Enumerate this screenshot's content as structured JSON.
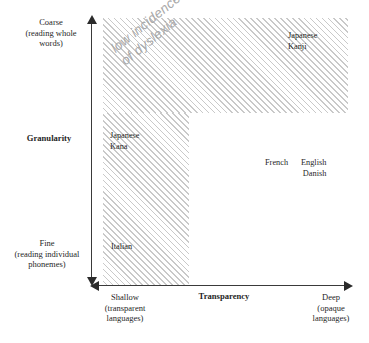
{
  "chart_data": {
    "type": "scatter",
    "title": "",
    "xlabel": "Transparency",
    "ylabel": "Granularity",
    "x_axis": {
      "label": "Transparency",
      "low_end": "Shallow\n(transparent\nlanguages)",
      "high_end": "Deep\n(opaque\nlanguages)",
      "arrows": "both"
    },
    "y_axis": {
      "label": "Granularity",
      "high_end": "Coarse\n(reading whole\nwords)",
      "low_end": "Fine\n(reading individual\nphonemes)",
      "arrows": "both"
    },
    "grid": false,
    "legend": "none",
    "annotations": [
      {
        "text": "low incidence\nof dyslexia",
        "style": "italic-gray-rotated",
        "rotation_deg": -39,
        "region": "L-shaped hatched band"
      }
    ],
    "regions": [
      {
        "name": "low-incidence-of-dyslexia",
        "shape": "L",
        "fill": "diagonal-hatch",
        "fill_color": "#c9c9c9",
        "description": "Shallow transparency column plus coarse granularity row"
      }
    ],
    "points": [
      {
        "label": "Japanese\nKanji",
        "transparency": "deep",
        "granularity": "coarse",
        "in_region": true
      },
      {
        "label": "Japanese\nKana",
        "transparency": "shallow",
        "granularity": "mid",
        "in_region": true
      },
      {
        "label": "Italian",
        "transparency": "shallow",
        "granularity": "fine",
        "in_region": true
      },
      {
        "label": "French",
        "transparency": "deep-ish",
        "granularity": "mid-fine",
        "in_region": false
      },
      {
        "label": "English\nDanish",
        "transparency": "deep",
        "granularity": "mid-fine",
        "in_region": false
      }
    ]
  },
  "axes": {
    "y": {
      "top_label": "Coarse\n(reading whole\nwords)",
      "title": "Granularity",
      "bottom_label": "Fine\n(reading individual\nphonemes)"
    },
    "x": {
      "left_label": "Shallow\n(transparent\nlanguages)",
      "title": "Transparency",
      "right_label": "Deep\n(opaque\nlanguages)"
    }
  },
  "annotation": {
    "dyslexia_text": "low incidence\nof dyslexia"
  },
  "points": {
    "japanese_kanji": "Japanese\nKanji",
    "japanese_kana": "Japanese\nKana",
    "italian": "Italian",
    "french": "French",
    "english_danish": "English\nDanish"
  },
  "colors": {
    "hatch": "#c9c9c9",
    "axis": "#2b2b2b",
    "text": "#1f1f1f",
    "annotation": "#a8a8a8",
    "background": "#ffffff"
  }
}
